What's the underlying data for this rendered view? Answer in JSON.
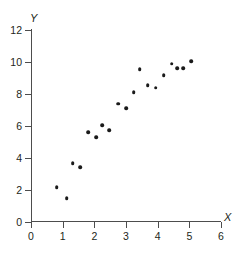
{
  "chart_data": {
    "type": "scatter",
    "title": "",
    "xlabel": "X",
    "ylabel": "Y",
    "xlim": [
      0,
      6
    ],
    "ylim": [
      0,
      12
    ],
    "xticks": [
      0,
      1,
      2,
      3,
      4,
      5,
      6
    ],
    "yticks": [
      0,
      2,
      4,
      6,
      8,
      10,
      12
    ],
    "xtick_labels": [
      "0",
      "1",
      "2",
      "3",
      "4",
      "5",
      "6"
    ],
    "ytick_labels": [
      "0",
      "2",
      "4",
      "6",
      "8",
      "10",
      "12"
    ],
    "grid": false,
    "legend": null,
    "marker": {
      "shape": "circle",
      "color": "#1a1a1a",
      "size": 3.6
    },
    "axis_color": "#4d4d4d",
    "background": "#ffffff",
    "n_points": 22,
    "points": [
      {
        "x": 0.81,
        "y": 2.19
      },
      {
        "x": 1.13,
        "y": 1.5
      },
      {
        "x": 1.31,
        "y": 3.69
      },
      {
        "x": 1.56,
        "y": 3.44
      },
      {
        "x": 1.81,
        "y": 5.62
      },
      {
        "x": 2.06,
        "y": 5.31
      },
      {
        "x": 2.25,
        "y": 6.06
      },
      {
        "x": 2.47,
        "y": 5.75
      },
      {
        "x": 2.75,
        "y": 7.38
      },
      {
        "x": 3.0,
        "y": 7.12
      },
      {
        "x": 3.25,
        "y": 8.12
      },
      {
        "x": 3.44,
        "y": 9.56
      },
      {
        "x": 3.69,
        "y": 8.56
      },
      {
        "x": 3.94,
        "y": 8.38
      },
      {
        "x": 4.19,
        "y": 9.19
      },
      {
        "x": 4.44,
        "y": 9.88
      },
      {
        "x": 4.62,
        "y": 9.62
      },
      {
        "x": 4.81,
        "y": 9.62
      },
      {
        "x": 5.06,
        "y": 10.06
      }
    ]
  }
}
